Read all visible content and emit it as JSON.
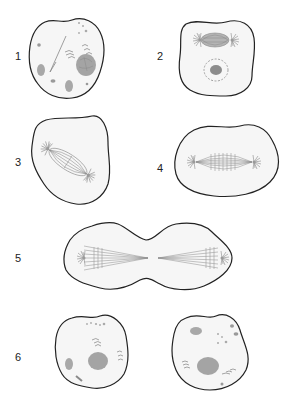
{
  "diagram": {
    "type": "cell-division-stages",
    "panels": [
      {
        "label": "1",
        "description": "interphase cell with nucleus, organelles and centrioles"
      },
      {
        "label": "2",
        "description": "prophase: spindle forming with asters, nucleus with dashed envelope"
      },
      {
        "label": "3",
        "description": "tilted spindle with asters at poles"
      },
      {
        "label": "4",
        "description": "horizontal spindle with asters at poles"
      },
      {
        "label": "5",
        "description": "dumbbell-shaped cell, spindles separating toward poles"
      },
      {
        "label": "6",
        "description": "two daughter cells with nuclei and organelles"
      }
    ],
    "colors": {
      "outline": "#222222",
      "cytoplasm": "#f6f6f6",
      "structure": "#8a8a8a",
      "fiber": "#9a9a9a",
      "nucleus": "#9c9c9c",
      "label": "#222222"
    }
  }
}
